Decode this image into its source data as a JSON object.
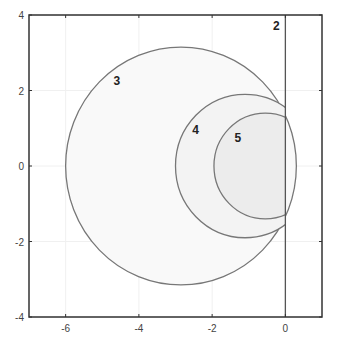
{
  "chart_data": {
    "type": "line",
    "title": "",
    "xlabel": "",
    "ylabel": "",
    "xlim": [
      -7,
      1
    ],
    "ylim": [
      -4,
      4
    ],
    "grid": true,
    "x_ticks": [
      -6,
      -4,
      -2,
      0
    ],
    "x_tick_labels": [
      "-6",
      "-4",
      "-2",
      "0"
    ],
    "y_ticks": [
      -4,
      -2,
      0,
      2,
      4
    ],
    "y_tick_labels": [
      "-4",
      "-2",
      "0",
      "2",
      "4"
    ],
    "series": [
      {
        "name": "2",
        "shape": "vertical-line",
        "x": 0,
        "label_pos": [
          -0.25,
          3.7
        ],
        "fill": "none"
      },
      {
        "name": "3",
        "shape": "circle",
        "center": [
          -2.85,
          0
        ],
        "radius": 3.15,
        "clip_x_max": 0.33,
        "label_pos": [
          -4.6,
          2.25
        ],
        "fill": "#f9f9f9"
      },
      {
        "name": "4",
        "shape": "circle",
        "center": [
          -1.1,
          0
        ],
        "radius": 1.9,
        "clip_x_max": 0,
        "label_pos": [
          -2.45,
          0.95
        ],
        "fill": "#f3f3f3"
      },
      {
        "name": "5",
        "shape": "circle",
        "center": [
          -0.55,
          0
        ],
        "radius": 1.4,
        "clip_x_max": 0,
        "label_pos": [
          -1.3,
          0.75
        ],
        "fill": "#ececec"
      }
    ],
    "line_color": "#777777",
    "frame_color": "#333333"
  }
}
